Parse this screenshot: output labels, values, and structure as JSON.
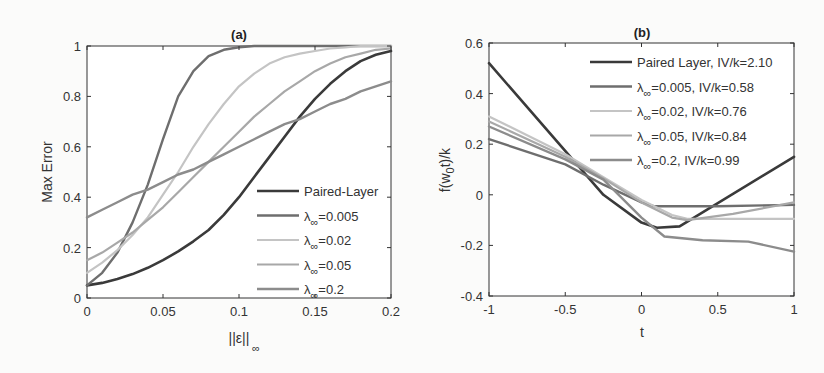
{
  "chart_data": [
    {
      "type": "line",
      "title": "(a)",
      "xlabel": "||ε||",
      "xlabel_sub": "∞",
      "ylabel": "Max Error",
      "xlim": [
        0,
        0.2
      ],
      "ylim": [
        0,
        1
      ],
      "xticks": [
        0,
        0.05,
        0.1,
        0.15,
        0.2
      ],
      "xtick_labels": [
        "0",
        "0.05",
        "0.1",
        "0.15",
        "0.2"
      ],
      "yticks": [
        0,
        0.2,
        0.4,
        0.6,
        0.8,
        1
      ],
      "ytick_labels": [
        "0",
        "0.2",
        "0.4",
        "0.6",
        "0.8",
        "1"
      ],
      "grid": false,
      "legend_position": "lower right",
      "x": [
        0,
        0.01,
        0.02,
        0.03,
        0.04,
        0.05,
        0.06,
        0.07,
        0.08,
        0.09,
        0.1,
        0.11,
        0.12,
        0.13,
        0.14,
        0.15,
        0.16,
        0.17,
        0.18,
        0.19,
        0.2
      ],
      "series": [
        {
          "name": "Paired-Layer",
          "label": "Paired-Layer",
          "color": "#3a3a3a",
          "width": 2.6,
          "values": [
            0.05,
            0.06,
            0.075,
            0.095,
            0.12,
            0.15,
            0.185,
            0.225,
            0.27,
            0.33,
            0.4,
            0.48,
            0.56,
            0.64,
            0.72,
            0.79,
            0.85,
            0.9,
            0.94,
            0.965,
            0.98
          ]
        },
        {
          "name": "lambda_inf=0.005",
          "label": "λ",
          "label_sub": "∞",
          "label_rest": "=0.005",
          "color": "#6e6e6e",
          "width": 2.4,
          "values": [
            0.05,
            0.1,
            0.18,
            0.3,
            0.45,
            0.63,
            0.8,
            0.9,
            0.96,
            0.985,
            0.995,
            1,
            1,
            1,
            1,
            1,
            1,
            1,
            1,
            1,
            1
          ]
        },
        {
          "name": "lambda_inf=0.02",
          "label": "λ",
          "label_sub": "∞",
          "label_rest": "=0.02",
          "color": "#c4c4c4",
          "width": 2.2,
          "values": [
            0.1,
            0.14,
            0.19,
            0.25,
            0.32,
            0.41,
            0.5,
            0.6,
            0.69,
            0.77,
            0.84,
            0.89,
            0.93,
            0.955,
            0.97,
            0.98,
            0.99,
            0.995,
            1,
            1,
            1
          ]
        },
        {
          "name": "lambda_inf=0.05",
          "label": "λ",
          "label_sub": "∞",
          "label_rest": "=0.05",
          "color": "#a8a8a8",
          "width": 2.2,
          "values": [
            0.15,
            0.18,
            0.22,
            0.26,
            0.31,
            0.36,
            0.42,
            0.48,
            0.54,
            0.6,
            0.66,
            0.72,
            0.77,
            0.82,
            0.86,
            0.9,
            0.93,
            0.955,
            0.97,
            0.985,
            0.99
          ]
        },
        {
          "name": "lambda_inf=0.2",
          "label": "λ",
          "label_sub": "∞",
          "label_rest": "=0.2",
          "color": "#8c8c8c",
          "width": 2.4,
          "values": [
            0.32,
            0.35,
            0.38,
            0.41,
            0.43,
            0.46,
            0.49,
            0.51,
            0.54,
            0.57,
            0.6,
            0.63,
            0.66,
            0.69,
            0.71,
            0.74,
            0.77,
            0.79,
            0.82,
            0.84,
            0.86
          ]
        }
      ]
    },
    {
      "type": "line",
      "title": "(b)",
      "xlabel": "t",
      "ylabel": "f(w",
      "ylabel_sub": "0",
      "ylabel_rest": "t)/k",
      "xlim": [
        -1,
        1
      ],
      "ylim": [
        -0.4,
        0.6
      ],
      "xticks": [
        -1,
        -0.5,
        0,
        0.5,
        1
      ],
      "xtick_labels": [
        "-1",
        "-0.5",
        "0",
        "0.5",
        "1"
      ],
      "yticks": [
        -0.4,
        -0.2,
        0,
        0.2,
        0.4,
        0.6
      ],
      "ytick_labels": [
        "-0.4",
        "-0.2",
        "0",
        "0.2",
        "0.4",
        "0.6"
      ],
      "grid": false,
      "legend_position": "upper right",
      "series": [
        {
          "name": "Paired Layer, IV/k=2.10",
          "label": "Paired Layer, IV/k=2.10",
          "color": "#3a3a3a",
          "width": 2.6,
          "x": [
            -1,
            -0.25,
            0,
            0.1,
            0.25,
            1
          ],
          "values": [
            0.52,
            0.0,
            -0.11,
            -0.13,
            -0.125,
            0.15
          ]
        },
        {
          "name": "lambda_inf=0.005, IV/k=0.58",
          "label": "λ",
          "label_sub": "∞",
          "label_rest": "=0.005, IV/k=0.58",
          "color": "#6e6e6e",
          "width": 2.4,
          "x": [
            -1,
            -0.5,
            -0.25,
            0,
            0.08,
            0.5,
            1
          ],
          "values": [
            0.22,
            0.12,
            0.04,
            -0.03,
            -0.045,
            -0.045,
            -0.04
          ]
        },
        {
          "name": "lambda_inf=0.02, IV/k=0.76",
          "label": "λ",
          "label_sub": "∞",
          "label_rest": "=0.02, IV/k=0.76",
          "color": "#c4c4c4",
          "width": 2.2,
          "x": [
            -1,
            -0.5,
            -0.25,
            0,
            0.2,
            0.3,
            0.5,
            1
          ],
          "values": [
            0.31,
            0.16,
            0.07,
            -0.02,
            -0.08,
            -0.095,
            -0.095,
            -0.095
          ]
        },
        {
          "name": "lambda_inf=0.05, IV/k=0.84",
          "label": "λ",
          "label_sub": "∞",
          "label_rest": "=0.05, IV/k=0.84",
          "color": "#a8a8a8",
          "width": 2.2,
          "x": [
            -1,
            -0.5,
            -0.25,
            0,
            0.2,
            0.3,
            0.6,
            1
          ],
          "values": [
            0.29,
            0.15,
            0.065,
            -0.03,
            -0.09,
            -0.1,
            -0.075,
            -0.03
          ]
        },
        {
          "name": "lambda_inf=0.2, IV/k=0.99",
          "label": "λ",
          "label_sub": "∞",
          "label_rest": "=0.2, IV/k=0.99",
          "color": "#8c8c8c",
          "width": 2.4,
          "x": [
            -1,
            -0.5,
            -0.25,
            0,
            0.15,
            0.4,
            0.7,
            1
          ],
          "values": [
            0.27,
            0.14,
            0.06,
            -0.09,
            -0.165,
            -0.18,
            -0.185,
            -0.225
          ]
        }
      ]
    }
  ]
}
